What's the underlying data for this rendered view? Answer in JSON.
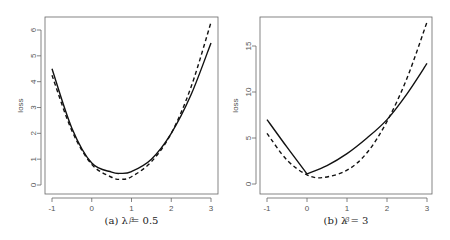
{
  "chart_data": [
    {
      "type": "line",
      "caption": "(a)  λ = 0.5",
      "xlabel": "β",
      "ylabel": "loss",
      "xlim": [
        -1,
        3
      ],
      "ylim": [
        0,
        6
      ],
      "xticks": [
        -1,
        0,
        1,
        2,
        3
      ],
      "yticks": [
        0,
        1,
        2,
        3,
        4,
        5,
        6
      ],
      "grid": false,
      "legend": null,
      "series": [
        {
          "name": "solid",
          "style": "solid",
          "x": [
            -1,
            -0.5,
            0,
            0.5,
            0.72,
            1,
            1.5,
            2,
            2.5,
            3
          ],
          "y": [
            4.5,
            2.2,
            0.85,
            0.5,
            0.45,
            0.52,
            1.0,
            2.0,
            3.5,
            5.5
          ]
        },
        {
          "name": "dashed",
          "style": "dashed",
          "x": [
            -1,
            -0.5,
            0,
            0.5,
            0.75,
            1,
            1.5,
            2,
            2.5,
            3
          ],
          "y": [
            4.25,
            2.1,
            0.8,
            0.3,
            0.22,
            0.32,
            0.9,
            2.0,
            3.8,
            6.3
          ]
        }
      ]
    },
    {
      "type": "line",
      "caption": "(b)  λ = 3",
      "xlabel": "β",
      "ylabel": "loss",
      "xlim": [
        -1,
        3
      ],
      "ylim": [
        0,
        17.6
      ],
      "xticks": [
        -1,
        0,
        1,
        2,
        3
      ],
      "yticks": [
        0,
        5,
        10,
        15
      ],
      "grid": false,
      "legend": null,
      "series": [
        {
          "name": "solid",
          "style": "solid",
          "x": [
            -1,
            -0.5,
            0,
            0.5,
            1,
            1.5,
            2,
            2.5,
            3
          ],
          "y": [
            7.0,
            4.0,
            1.1,
            2.0,
            3.3,
            5.0,
            7.0,
            9.8,
            13.1
          ]
        },
        {
          "name": "dashed",
          "style": "dashed",
          "x": [
            -1,
            -0.5,
            0,
            0.4,
            1,
            1.5,
            2,
            2.5,
            3
          ],
          "y": [
            5.5,
            2.6,
            1.0,
            0.7,
            1.5,
            3.4,
            6.8,
            11.5,
            17.6
          ]
        }
      ]
    }
  ]
}
